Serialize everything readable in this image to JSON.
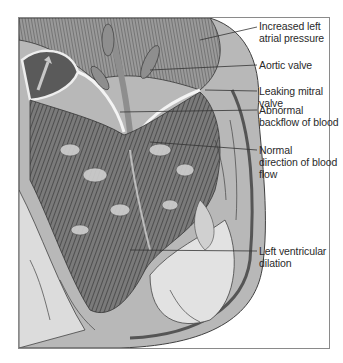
{
  "figure": {
    "labels": [
      {
        "id": "increased-left-atrial-pressure",
        "lines": [
          "Increased left",
          "atrial pressure"
        ],
        "x": 259,
        "y": 20
      },
      {
        "id": "aortic-valve",
        "lines": [
          "Aortic valve"
        ],
        "x": 259,
        "y": 59
      },
      {
        "id": "leaking-mitral-valve",
        "lines": [
          "Leaking mitral valve"
        ],
        "x": 259,
        "y": 85
      },
      {
        "id": "abnormal-backflow-of-blood",
        "lines": [
          "Abnormal",
          "backflow of blood"
        ],
        "x": 259,
        "y": 104
      },
      {
        "id": "normal-direction-of-blood-flow",
        "lines": [
          "Normal",
          "direction of blood",
          "flow"
        ],
        "x": 259,
        "y": 143
      },
      {
        "id": "left-ventricular-dilation",
        "lines": [
          "Left ventricular",
          "dilation"
        ],
        "x": 259,
        "y": 245
      }
    ],
    "colors": {
      "frame": "#8a8a8a",
      "dark_tissue": "#4a4a4a",
      "mid_tissue": "#8c8c8c",
      "light_tissue": "#d8d8d8",
      "leader": "#333333"
    }
  }
}
